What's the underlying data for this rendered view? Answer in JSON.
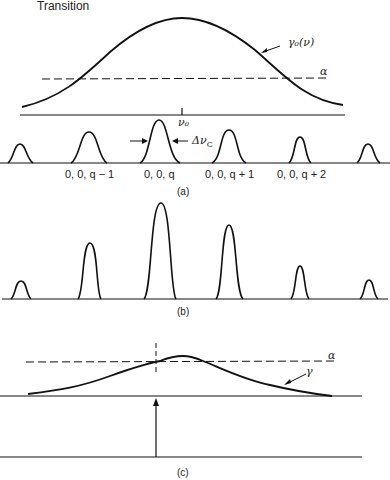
{
  "title": "Transition",
  "panel_a": {
    "caption": "(a)",
    "gain_label": "γ₀(ν)",
    "loss_label": "α",
    "center_label": "ν₀",
    "linewidth_label": "Δν",
    "linewidth_sub": "C",
    "modes": [
      {
        "label": ""
      },
      {
        "label": "0, 0, q − 1"
      },
      {
        "label": "0, 0, q"
      },
      {
        "label": "0, 0, q + 1"
      },
      {
        "label": "0, 0, q + 2"
      },
      {
        "label": ""
      }
    ]
  },
  "panel_b": {
    "caption": "(b)"
  },
  "panel_c": {
    "caption": "(c)",
    "gain_label": "γ",
    "loss_label": "α"
  },
  "colors": {
    "ink": "#111111",
    "background": "#ffffff"
  }
}
